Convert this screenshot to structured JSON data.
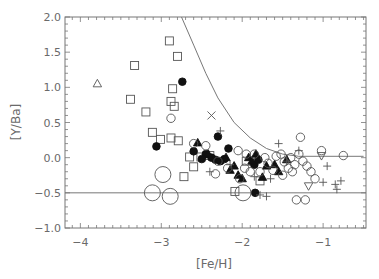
{
  "chart_data": {
    "type": "scatter",
    "title": "",
    "xlabel": "[Fe/H]",
    "ylabel": "[Y/Ba]",
    "xlim": [
      -4.19,
      -0.47
    ],
    "ylim": [
      -1.0,
      2.0
    ],
    "xticks": [
      -4,
      -3,
      -2,
      -1
    ],
    "xtick_labels": [
      "−4",
      "−3",
      "−2",
      "−1"
    ],
    "yticks": [
      -1.0,
      -0.5,
      0.0,
      0.5,
      1.0,
      1.5,
      2.0
    ],
    "ytick_labels": [
      "−1.0",
      "−0.5",
      "0.0",
      "0.5",
      "1.0",
      "1.5",
      "2.0"
    ],
    "grid": false,
    "legend": null,
    "reference_lines": [
      {
        "name": "lower-limit-line",
        "type": "horizontal",
        "y": -0.5
      },
      {
        "name": "upper-envelope-curve",
        "type": "curve",
        "points": [
          [
            -2.75,
            2.0
          ],
          [
            -2.6,
            1.6
          ],
          [
            -2.45,
            1.2
          ],
          [
            -2.3,
            0.85
          ],
          [
            -2.1,
            0.5
          ],
          [
            -1.9,
            0.28
          ],
          [
            -1.7,
            0.13
          ],
          [
            -1.5,
            0.05
          ],
          [
            -1.3,
            0.02
          ],
          [
            -1.0,
            0.02
          ],
          [
            -0.5,
            0.02
          ]
        ]
      }
    ],
    "series": [
      {
        "name": "open-squares",
        "marker": "square",
        "filled": false,
        "points": [
          [
            -2.9,
            1.66
          ],
          [
            -2.8,
            1.44
          ],
          [
            -3.33,
            1.31
          ],
          [
            -2.86,
            0.98
          ],
          [
            -3.38,
            0.83
          ],
          [
            -2.88,
            0.8
          ],
          [
            -2.84,
            0.73
          ],
          [
            -3.19,
            0.65
          ],
          [
            -3.11,
            0.36
          ],
          [
            -3.01,
            0.26
          ],
          [
            -2.88,
            0.28
          ],
          [
            -2.79,
            0.24
          ],
          [
            -2.65,
            0.01
          ],
          [
            -2.51,
            0.01
          ],
          [
            -2.6,
            -0.13
          ],
          [
            -2.72,
            -0.27
          ],
          [
            -2.09,
            -0.48
          ],
          [
            -1.78,
            -0.33
          ],
          [
            -2.4,
            0.03
          ],
          [
            -1.95,
            -0.05
          ]
        ]
      },
      {
        "name": "open-triangle",
        "marker": "triangle",
        "filled": false,
        "points": [
          [
            -3.79,
            1.05
          ]
        ]
      },
      {
        "name": "filled-circles",
        "marker": "circle",
        "filled": true,
        "points": [
          [
            -2.74,
            1.08
          ],
          [
            -3.06,
            0.16
          ],
          [
            -2.6,
            0.09
          ],
          [
            -2.17,
            0.13
          ],
          [
            -2.3,
            0.3
          ],
          [
            -1.84,
            -0.5
          ],
          [
            -2.45,
            0.05
          ],
          [
            -2.38,
            0.0
          ],
          [
            -2.33,
            -0.03
          ],
          [
            -2.27,
            -0.05
          ],
          [
            -2.22,
            -0.02
          ],
          [
            -1.85,
            -0.1
          ],
          [
            -1.8,
            -0.03
          ],
          [
            -2.5,
            -0.02
          ]
        ]
      },
      {
        "name": "filled-triangles",
        "marker": "triangle",
        "filled": true,
        "points": [
          [
            -2.55,
            0.21
          ],
          [
            -2.42,
            0.05
          ],
          [
            -2.2,
            0.0
          ],
          [
            -2.1,
            -0.12
          ],
          [
            -2.05,
            -0.25
          ],
          [
            -2.15,
            -0.18
          ],
          [
            -1.92,
            0.0
          ],
          [
            -1.88,
            -0.05
          ],
          [
            -1.83,
            0.05
          ],
          [
            -1.7,
            -0.12
          ],
          [
            -1.55,
            -0.2
          ],
          [
            -1.75,
            -0.28
          ],
          [
            -2.0,
            -0.3
          ],
          [
            -1.45,
            -0.03
          ],
          [
            -1.6,
            -0.1
          ]
        ]
      },
      {
        "name": "open-circles",
        "marker": "circle",
        "filled": false,
        "points": [
          [
            -2.88,
            0.56
          ],
          [
            -2.6,
            0.2
          ],
          [
            -2.45,
            0.17
          ],
          [
            -2.3,
            -0.05
          ],
          [
            -2.18,
            -0.15
          ],
          [
            -2.33,
            -0.23
          ],
          [
            -2.03,
            -0.3
          ],
          [
            -1.97,
            -0.15
          ],
          [
            -1.9,
            -0.2
          ],
          [
            -1.85,
            0.05
          ],
          [
            -1.78,
            -0.2
          ],
          [
            -1.72,
            0.0
          ],
          [
            -1.68,
            -0.08
          ],
          [
            -1.62,
            -0.18
          ],
          [
            -1.58,
            0.02
          ],
          [
            -1.52,
            0.05
          ],
          [
            -1.48,
            -0.06
          ],
          [
            -1.43,
            -0.15
          ],
          [
            -1.4,
            0.0
          ],
          [
            -1.35,
            -0.1
          ],
          [
            -1.3,
            0.05
          ],
          [
            -1.25,
            -0.05
          ],
          [
            -1.2,
            -0.12
          ],
          [
            -1.15,
            -0.2
          ],
          [
            -1.1,
            -0.3
          ],
          [
            -1.28,
            0.29
          ],
          [
            -1.02,
            0.1
          ],
          [
            -0.75,
            0.03
          ],
          [
            -1.22,
            -0.6
          ],
          [
            -1.33,
            -0.6
          ],
          [
            -1.95,
            0.05
          ],
          [
            -2.05,
            0.1
          ],
          [
            -1.5,
            -0.25
          ],
          [
            -1.38,
            -0.2
          ]
        ]
      },
      {
        "name": "large-open-circles",
        "marker": "circle-large",
        "filled": false,
        "points": [
          [
            -2.98,
            -0.24
          ],
          [
            -3.11,
            -0.5
          ],
          [
            -2.89,
            -0.55
          ],
          [
            -1.99,
            -0.5
          ]
        ]
      },
      {
        "name": "plus-signs",
        "marker": "plus",
        "filled": false,
        "points": [
          [
            -2.27,
            0.38
          ],
          [
            -2.4,
            -0.2
          ],
          [
            -2.15,
            -0.1
          ],
          [
            -1.85,
            -0.27
          ],
          [
            -1.78,
            -0.53
          ],
          [
            -1.7,
            -0.55
          ],
          [
            -1.55,
            0.2
          ],
          [
            -1.45,
            -0.05
          ],
          [
            -0.95,
            -0.12
          ],
          [
            -0.85,
            -0.38
          ],
          [
            -0.78,
            -0.33
          ],
          [
            -0.83,
            -0.45
          ],
          [
            -1.0,
            -0.35
          ],
          [
            -1.65,
            -0.3
          ],
          [
            -1.3,
            0.1
          ]
        ]
      },
      {
        "name": "x-marks",
        "marker": "cross",
        "filled": false,
        "points": [
          [
            -2.38,
            0.6
          ]
        ]
      },
      {
        "name": "open-inverted-triangles",
        "marker": "triangle-down",
        "filled": false,
        "points": [
          [
            -1.02,
            0.03
          ],
          [
            -1.18,
            -0.4
          ]
        ]
      }
    ]
  }
}
